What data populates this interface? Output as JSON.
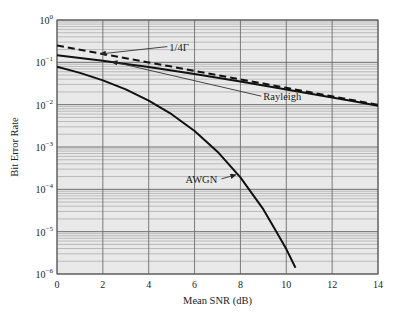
{
  "chart_data": {
    "type": "line",
    "title": "",
    "xlabel": "Mean SNR (dB)",
    "ylabel": "Bit Error Rate",
    "xlim": [
      0,
      14
    ],
    "ylim": [
      1e-06,
      1
    ],
    "yscale": "log",
    "grid": true,
    "x_ticks": [
      0,
      2,
      4,
      6,
      8,
      10,
      12,
      14
    ],
    "y_ticks": [
      {
        "base": "10",
        "exp": "0"
      },
      {
        "base": "10",
        "exp": "−1"
      },
      {
        "base": "10",
        "exp": "−2"
      },
      {
        "base": "10",
        "exp": "−3"
      },
      {
        "base": "10",
        "exp": "−4"
      },
      {
        "base": "10",
        "exp": "−5"
      },
      {
        "base": "10",
        "exp": "−6"
      }
    ],
    "series": [
      {
        "name": "Rayleigh",
        "style": "solid",
        "x": [
          0,
          1,
          2,
          3,
          4,
          5,
          6,
          7,
          8,
          9,
          10,
          11,
          12,
          13,
          14
        ],
        "y": [
          0.1464,
          0.1267,
          0.1085,
          0.0919,
          0.077,
          0.064,
          0.0526,
          0.043,
          0.035,
          0.0283,
          0.0228,
          0.0183,
          0.0147,
          0.0118,
          0.0094
        ]
      },
      {
        "name": "1/4Γ",
        "style": "dashed",
        "x": [
          0,
          1,
          2,
          3,
          4,
          5,
          6,
          7,
          8,
          9,
          10,
          11,
          12,
          13,
          14
        ],
        "y": [
          0.25,
          0.1986,
          0.1577,
          0.1253,
          0.0995,
          0.0791,
          0.0628,
          0.0499,
          0.0396,
          0.0315,
          0.025,
          0.0199,
          0.0158,
          0.0125,
          0.0099
        ]
      },
      {
        "name": "AWGN",
        "style": "solid",
        "x": [
          0,
          1,
          2,
          3,
          4,
          5,
          6,
          7,
          8,
          9,
          9.5,
          10,
          10.4
        ],
        "y": [
          0.0786,
          0.0563,
          0.0375,
          0.0229,
          0.0125,
          0.00595,
          0.00239,
          0.000773,
          0.000191,
          3.36e-05,
          1.15e-05,
          3.87e-06,
          1.4e-06
        ]
      }
    ],
    "annotations": [
      {
        "text": "1/4Γ",
        "target": "1/4Γ",
        "label_x_db": 4.9,
        "label_y": 0.2,
        "arrow_to_x_db": 1.9,
        "arrow_to_y": 0.158
      },
      {
        "text": "Rayleigh",
        "target": "Rayleigh",
        "label_x_db": 9.0,
        "label_y": 0.0135,
        "arrow_to_x_db": 2.4,
        "arrow_to_y": 0.104
      },
      {
        "text": "AWGN",
        "target": "AWGN",
        "label_x_db": 5.6,
        "label_y": 0.00015,
        "arrow_to_x_db": 7.8,
        "arrow_to_y": 0.00022
      }
    ]
  },
  "colors": {
    "plot_bg": "#e9e9e9",
    "major_grid": "#6e6e6e",
    "minor_grid": "#9a9a9a",
    "curve": "#111111",
    "axis": "#555555"
  }
}
